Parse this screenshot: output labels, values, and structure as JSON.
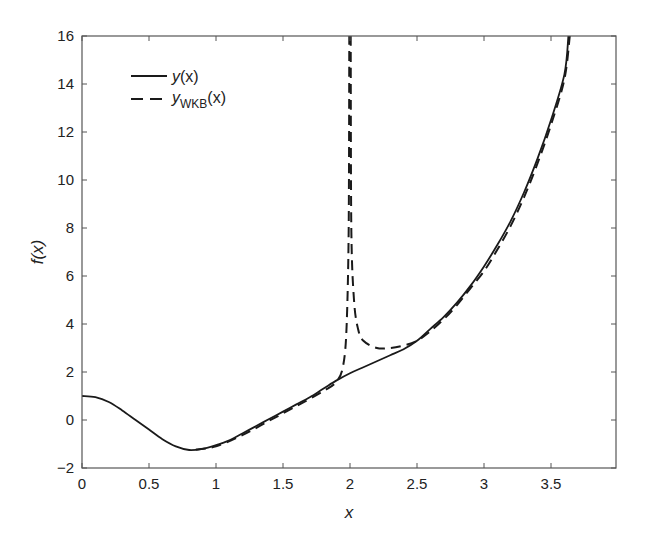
{
  "chart_data": {
    "type": "line",
    "title": "",
    "xlabel": "x",
    "ylabel": "f(x)",
    "xlim": [
      0,
      3.985
    ],
    "ylim": [
      -2,
      16
    ],
    "xticks": [
      0,
      0.5,
      1,
      1.5,
      2,
      2.5,
      3,
      3.5
    ],
    "xtick_labels": [
      "0",
      "0.5",
      "1",
      "1.5",
      "2",
      "2.5",
      "3",
      "3.5"
    ],
    "yticks": [
      -2,
      0,
      2,
      4,
      6,
      8,
      10,
      12,
      14,
      16
    ],
    "ytick_labels": [
      "−2",
      "0",
      "2",
      "4",
      "6",
      "8",
      "10",
      "12",
      "14",
      "16"
    ],
    "grid": false,
    "legend_position": "upper left",
    "series": [
      {
        "name": "y(x)",
        "style": "solid",
        "x": [
          0,
          0.1,
          0.2,
          0.3,
          0.4,
          0.5,
          0.6,
          0.7,
          0.8,
          0.9,
          1.0,
          1.1,
          1.2,
          1.3,
          1.4,
          1.5,
          1.6,
          1.7,
          1.8,
          1.9,
          2.0,
          2.1,
          2.2,
          2.3,
          2.4,
          2.5,
          2.6,
          2.7,
          2.8,
          2.9,
          3.0,
          3.1,
          3.2,
          3.3,
          3.4,
          3.5,
          3.6,
          3.63
        ],
        "values": [
          1.0,
          0.95,
          0.75,
          0.4,
          0.0,
          -0.4,
          -0.8,
          -1.1,
          -1.25,
          -1.2,
          -1.05,
          -0.85,
          -0.55,
          -0.25,
          0.05,
          0.35,
          0.65,
          0.95,
          1.3,
          1.65,
          1.95,
          2.2,
          2.45,
          2.7,
          2.95,
          3.3,
          3.8,
          4.3,
          4.9,
          5.6,
          6.4,
          7.3,
          8.3,
          9.5,
          10.9,
          12.5,
          14.4,
          16.0
        ]
      },
      {
        "name": "y_WKB(x) (left branch)",
        "style": "dashed",
        "x": [
          0.85,
          1.0,
          1.2,
          1.4,
          1.6,
          1.8,
          1.9,
          1.95,
          1.975,
          1.99,
          1.995
        ],
        "values": [
          -1.23,
          -1.1,
          -0.62,
          -0.02,
          0.58,
          1.2,
          1.6,
          2.3,
          4.0,
          8.0,
          16.0
        ]
      },
      {
        "name": "y_WKB(x) (right branch)",
        "style": "dashed",
        "x": [
          2.005,
          2.01,
          2.03,
          2.06,
          2.1,
          2.2,
          2.3,
          2.4,
          2.5,
          2.6,
          2.7,
          2.8,
          2.9,
          3.0,
          3.1,
          3.2,
          3.3,
          3.4,
          3.5,
          3.6,
          3.64
        ],
        "values": [
          16.0,
          8.0,
          5.0,
          3.8,
          3.3,
          3.0,
          3.0,
          3.1,
          3.3,
          3.7,
          4.2,
          4.8,
          5.5,
          6.2,
          7.1,
          8.1,
          9.3,
          10.7,
          12.3,
          14.2,
          16.0
        ]
      }
    ],
    "legend": [
      {
        "label": "y(x)",
        "style": "solid"
      },
      {
        "label": "y_WKB(x)",
        "style": "dashed"
      }
    ]
  },
  "legend": {
    "solid_main": "y",
    "solid_args": "(x)",
    "dashed_main": "y",
    "dashed_sub": "WKB",
    "dashed_args": "(x)"
  },
  "axes": {
    "xlabel": "x",
    "ylabel": "f(x)"
  },
  "colors": {
    "line": "#1a1a1a",
    "axis": "#555555"
  }
}
